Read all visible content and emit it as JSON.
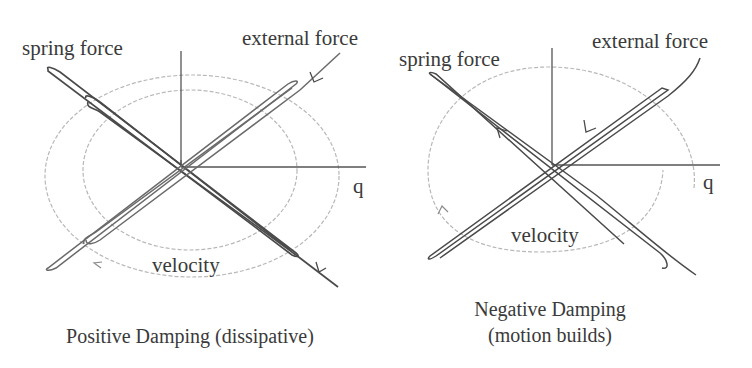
{
  "colors": {
    "background": "#ffffff",
    "force_line": "#4a4a4a",
    "axis": "#555555",
    "velocity_ellipse": "#b8b8b8",
    "text": "#3a3a3a"
  },
  "panels": [
    {
      "id": "positive",
      "labels": {
        "spring": "spring force",
        "external": "external force",
        "axis_q": "q",
        "velocity": "velocity"
      },
      "caption": [
        "Positive Damping (dissipative)"
      ]
    },
    {
      "id": "negative",
      "labels": {
        "spring": "spring force",
        "external": "external force",
        "axis_q": "q",
        "velocity": "velocity"
      },
      "caption": [
        "Negative Damping",
        "(motion builds)"
      ]
    }
  ]
}
